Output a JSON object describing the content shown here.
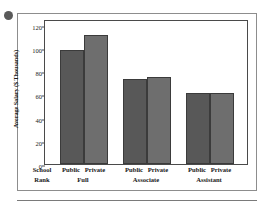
{
  "figure": {
    "bullet_icon": "bullet-dot"
  },
  "chart_data": {
    "type": "bar",
    "title": "",
    "xlabel": "School Rank",
    "ylabel": "Average Salary ($ Thousands)",
    "ylim": [
      0,
      125
    ],
    "yticks": [
      0,
      20,
      40,
      60,
      80,
      100,
      120
    ],
    "ytick_labels": [
      "0",
      "20",
      "40",
      "60",
      "80",
      "100",
      "120"
    ],
    "grid": false,
    "legend": "none",
    "categories": [
      "Full",
      "Associate",
      "Assistant"
    ],
    "series": [
      {
        "name": "Public",
        "values": [
          98,
          73,
          61
        ]
      },
      {
        "name": "Private",
        "values": [
          111,
          75,
          61
        ]
      }
    ],
    "bar_labels": [
      "Public",
      "Private"
    ],
    "colors": {
      "public": "#585858",
      "private": "#6e6e6e",
      "axis": "#4a4a4a",
      "frame": "#8d8d8d",
      "text": "#1a1a1a",
      "plot_background": "#ffffff"
    }
  }
}
